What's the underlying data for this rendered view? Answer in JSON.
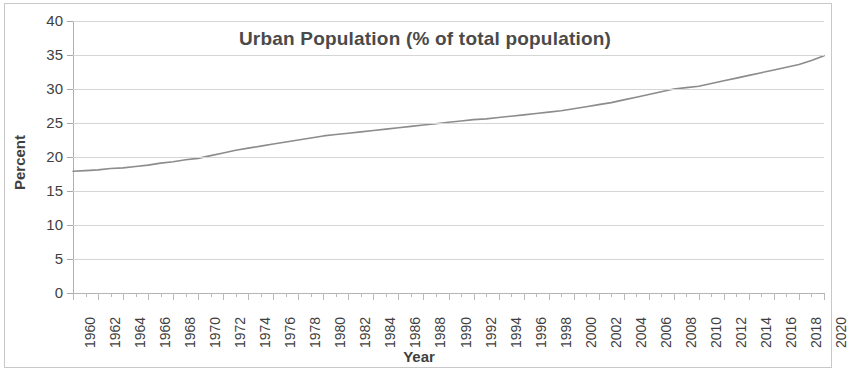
{
  "chart_data": {
    "type": "line",
    "title": "Urban Population (% of total population)",
    "xlabel": "Year",
    "ylabel": "Percent",
    "ylim": [
      0,
      40
    ],
    "ytick_step": 5,
    "yticks": [
      "40",
      "35",
      "30",
      "25",
      "20",
      "15",
      "10",
      "5",
      "0"
    ],
    "xlim": [
      1960,
      2020
    ],
    "grid": true,
    "legend": "none",
    "line_color": "#8c8c8c",
    "categories": [
      1960,
      1961,
      1962,
      1963,
      1964,
      1965,
      1966,
      1967,
      1968,
      1969,
      1970,
      1971,
      1972,
      1973,
      1974,
      1975,
      1976,
      1977,
      1978,
      1979,
      1980,
      1981,
      1982,
      1983,
      1984,
      1985,
      1986,
      1987,
      1988,
      1989,
      1990,
      1991,
      1992,
      1993,
      1994,
      1995,
      1996,
      1997,
      1998,
      1999,
      2000,
      2001,
      2002,
      2003,
      2004,
      2005,
      2006,
      2007,
      2008,
      2009,
      2010,
      2011,
      2012,
      2013,
      2014,
      2015,
      2016,
      2017,
      2018,
      2019,
      2020
    ],
    "values": [
      17.9,
      18.0,
      18.1,
      18.3,
      18.4,
      18.6,
      18.8,
      19.1,
      19.3,
      19.6,
      19.8,
      20.2,
      20.6,
      21.0,
      21.3,
      21.6,
      21.9,
      22.2,
      22.5,
      22.8,
      23.1,
      23.3,
      23.5,
      23.7,
      23.9,
      24.1,
      24.3,
      24.5,
      24.7,
      24.9,
      25.1,
      25.3,
      25.5,
      25.6,
      25.8,
      26.0,
      26.2,
      26.4,
      26.6,
      26.8,
      27.1,
      27.4,
      27.7,
      28.0,
      28.4,
      28.8,
      29.2,
      29.6,
      30.0,
      30.2,
      30.4,
      30.8,
      31.2,
      31.6,
      32.0,
      32.4,
      32.8,
      33.2,
      33.6,
      34.2,
      34.9
    ],
    "xticks": [
      "1960",
      "1962",
      "1964",
      "1966",
      "1968",
      "1970",
      "1972",
      "1974",
      "1976",
      "1978",
      "1980",
      "1982",
      "1984",
      "1986",
      "1988",
      "1990",
      "1992",
      "1994",
      "1996",
      "1998",
      "2000",
      "2002",
      "2004",
      "2006",
      "2008",
      "2010",
      "2012",
      "2014",
      "2016",
      "2018",
      "2020"
    ]
  }
}
